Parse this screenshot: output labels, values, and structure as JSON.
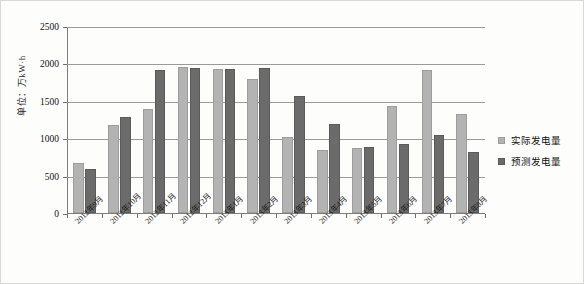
{
  "chart_data": {
    "type": "bar",
    "title": "",
    "subtitle": "",
    "xlabel": "",
    "ylabel": "单位：万kW·h",
    "ylim": [
      0,
      2500
    ],
    "ytick_values": [
      0,
      500,
      1000,
      1500,
      2000,
      2500
    ],
    "ytick_labels": [
      "0",
      "500",
      "1000",
      "1500",
      "2000",
      "2500"
    ],
    "grid": "horizontal",
    "legend_position": "right",
    "categories": [
      "2012年9月",
      "2012年10月",
      "2012年11月",
      "2012年12月",
      "2013年1月",
      "2013年2月",
      "2013年3月",
      "2013年4月",
      "2013年5月",
      "2013年6月",
      "2013年7月",
      "2013年8月"
    ],
    "series": [
      {
        "name": "实际发电量",
        "color": "#b3b3b3",
        "values": [
          665,
          1175,
          1390,
          1950,
          1930,
          1790,
          1010,
          840,
          875,
          1430,
          1915,
          1330
        ]
      },
      {
        "name": "预测发电量",
        "color": "#6b6b6b",
        "values": [
          595,
          1285,
          1910,
          1935,
          1930,
          1940,
          1570,
          1195,
          880,
          925,
          1040,
          810
        ]
      }
    ]
  },
  "legend": {
    "items": [
      {
        "label": "实际发电量",
        "swatch": "actual"
      },
      {
        "label": "预测发电量",
        "swatch": "forecast"
      }
    ]
  }
}
